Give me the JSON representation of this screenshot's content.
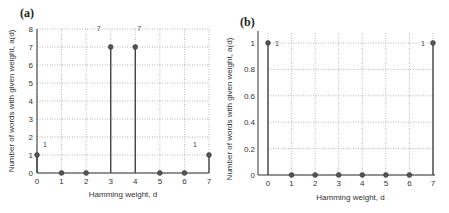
{
  "chart_data": [
    {
      "type": "stem",
      "panel_label": "(a)",
      "title": "",
      "xlabel": "Hamming weight, d",
      "ylabel": "Number of words with given weight, a(d)",
      "x": [
        0,
        1,
        2,
        3,
        4,
        5,
        6,
        7
      ],
      "values": [
        1,
        0,
        0,
        7,
        7,
        0,
        0,
        1
      ],
      "annotations": [
        {
          "text": "1",
          "x": 0,
          "y": 1
        },
        {
          "text": "7",
          "x": 3,
          "y": 7
        },
        {
          "text": "7",
          "x": 4,
          "y": 7
        },
        {
          "text": "1",
          "x": 7,
          "y": 1
        }
      ],
      "xlim": [
        0,
        7
      ],
      "ylim": [
        0,
        8
      ],
      "xticks": [
        "0",
        "1",
        "2",
        "3",
        "4",
        "5",
        "6",
        "7"
      ],
      "yticks": [
        "0",
        "1",
        "2",
        "3",
        "4",
        "5",
        "6",
        "7",
        "8"
      ],
      "grid": true,
      "legend": null
    },
    {
      "type": "stem",
      "panel_label": "(b)",
      "title": "",
      "xlabel": "Hamming weight, d",
      "ylabel": "Number of words with given weight, a(d)",
      "x": [
        0,
        1,
        2,
        3,
        4,
        5,
        6,
        7
      ],
      "values": [
        1,
        0,
        0,
        0,
        0,
        0,
        0,
        1
      ],
      "annotations": [
        {
          "text": "1",
          "x": 0,
          "y": 1
        },
        {
          "text": "1",
          "x": 7,
          "y": 1
        }
      ],
      "xlim": [
        0,
        7
      ],
      "ylim": [
        0,
        1
      ],
      "xticks": [
        "0",
        "1",
        "2",
        "3",
        "4",
        "5",
        "6",
        "7"
      ],
      "yticks": [
        "0",
        "0.2",
        "0.4",
        "0.6",
        "0.8",
        "1"
      ],
      "grid": true,
      "legend": null
    }
  ],
  "colors": {
    "stem": "#444444",
    "marker": "#555555",
    "grid": "#999999",
    "axis": "#333333"
  }
}
